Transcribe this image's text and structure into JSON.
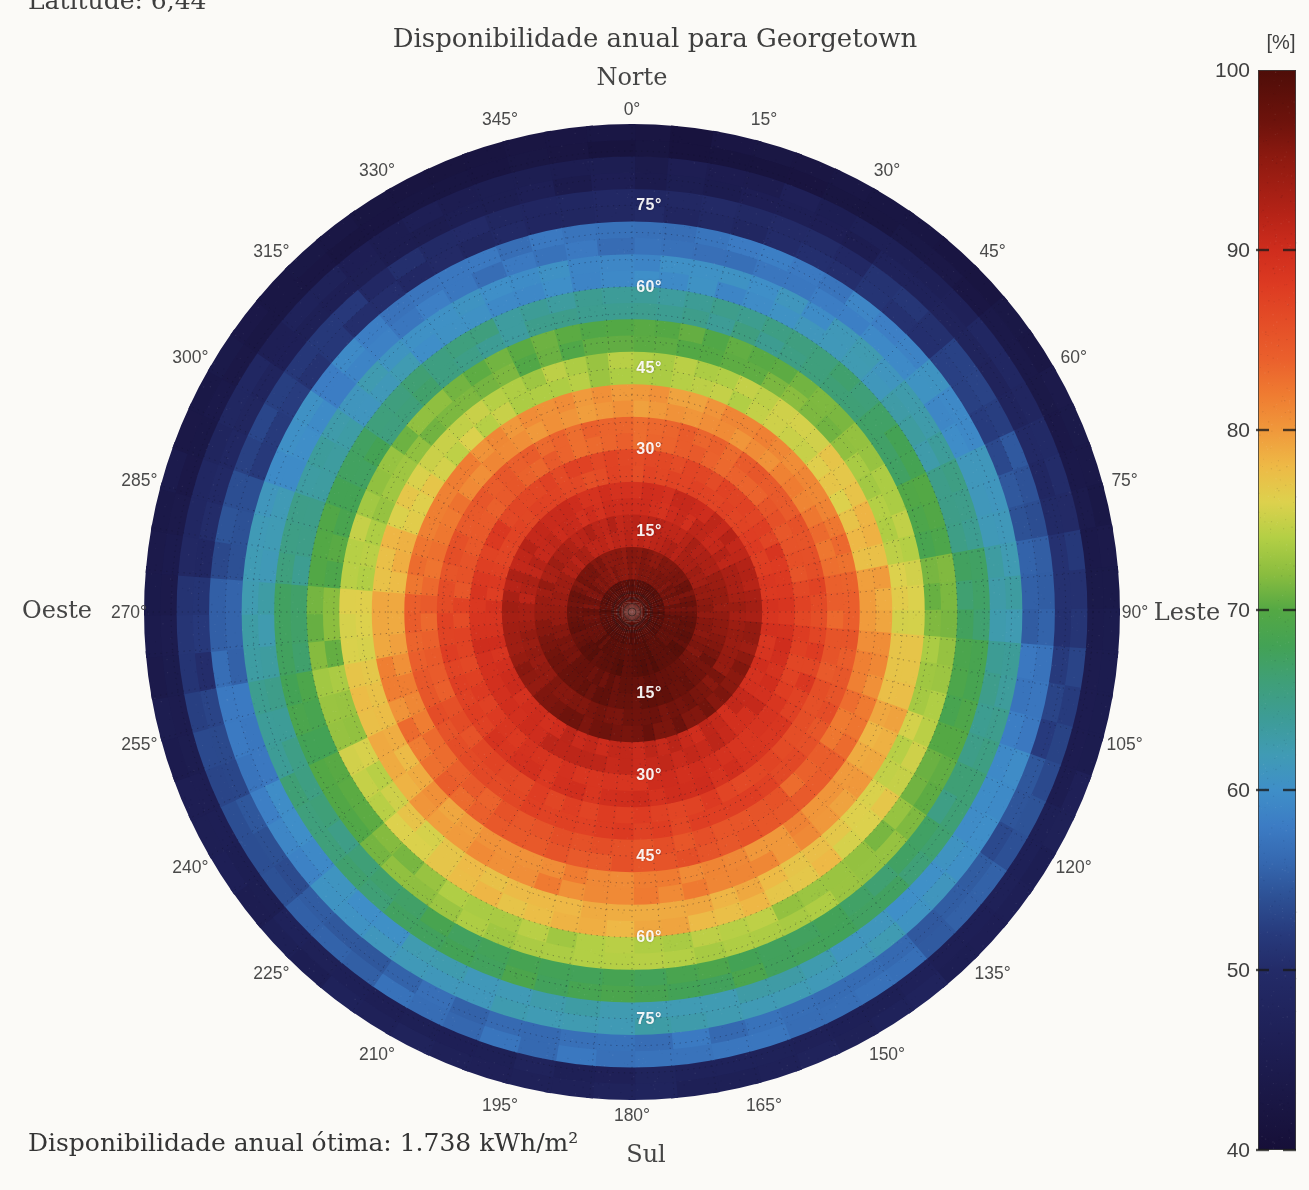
{
  "page": {
    "latitude_label": "Latitude: 6,44",
    "footer_label": "Disponibilidade anual ótima: 1.738 kWh/m²"
  },
  "chart_data": {
    "type": "polar_heatmap",
    "title": "Disponibilidade anual para Georgetown",
    "subtitle": "",
    "quantity": "Disponibilidade anual",
    "unit": "%",
    "optimal_annual_availability": "1.738 kWh/m²",
    "cardinals": {
      "north": "Norte",
      "east": "Leste",
      "south": "Sul",
      "west": "Oeste"
    },
    "azimuth_step_deg": 15,
    "azimuth_tick_labels": [
      "0°",
      "15°",
      "30°",
      "45°",
      "60°",
      "75°",
      "90°",
      "105°",
      "120°",
      "135°",
      "150°",
      "165°",
      "180°",
      "195°",
      "210°",
      "225°",
      "240°",
      "255°",
      "270°",
      "285°",
      "300°",
      "315°",
      "330°",
      "345°"
    ],
    "radial_axis": {
      "quantity": "inclinação",
      "min_deg": 0,
      "max_deg": 90,
      "ring_step_deg": 6,
      "label_step_deg": 15
    },
    "radial_tick_labels": [
      "15°",
      "30°",
      "45°",
      "60°",
      "75°"
    ],
    "tilt_ring_mid_deg": [
      3,
      9,
      15,
      21,
      27,
      33,
      39,
      45,
      51,
      57,
      63,
      69,
      75,
      81,
      87
    ],
    "values_by_azimuth": [
      {
        "azimuth_deg": 0,
        "values": [
          98.5,
          95.5,
          91.5,
          89.5,
          86.5,
          83.5,
          80.0,
          73.5,
          70.0,
          64.0,
          59.5,
          57.0,
          49.0,
          45.0,
          42.0
        ]
      },
      {
        "azimuth_deg": 15,
        "values": [
          98.5,
          95.6,
          91.6,
          89.6,
          86.6,
          83.6,
          80.1,
          73.7,
          70.2,
          64.2,
          59.7,
          57.2,
          49.2,
          45.2,
          42.1
        ]
      },
      {
        "azimuth_deg": 30,
        "values": [
          98.6,
          95.7,
          91.9,
          90.0,
          86.8,
          83.9,
          80.5,
          74.3,
          70.8,
          64.9,
          60.4,
          57.8,
          49.9,
          45.8,
          42.3
        ]
      },
      {
        "azimuth_deg": 45,
        "values": [
          98.6,
          96.0,
          92.4,
          90.6,
          87.2,
          84.4,
          81.1,
          75.2,
          71.7,
          66.1,
          61.6,
          58.7,
          51.0,
          46.7,
          42.7
        ]
      },
      {
        "azimuth_deg": 60,
        "values": [
          98.8,
          96.4,
          93.1,
          91.4,
          87.6,
          85.0,
          81.9,
          76.5,
          72.9,
          67.6,
          63.1,
          59.9,
          52.4,
          48.0,
          43.3
        ]
      },
      {
        "azimuth_deg": 75,
        "values": [
          98.9,
          96.8,
          93.9,
          92.3,
          88.2,
          85.7,
          82.8,
          77.9,
          74.3,
          69.4,
          64.9,
          61.3,
          54.0,
          49.4,
          43.9
        ]
      },
      {
        "azimuth_deg": 90,
        "values": [
          99.0,
          97.3,
          94.8,
          93.3,
          88.8,
          86.5,
          83.8,
          79.5,
          75.8,
          71.3,
          66.8,
          62.8,
          55.8,
          51.0,
          44.5
        ]
      },
      {
        "azimuth_deg": 105,
        "values": [
          99.1,
          97.7,
          95.6,
          94.2,
          89.3,
          87.3,
          84.7,
          81.1,
          77.3,
          73.1,
          68.6,
          64.3,
          57.5,
          52.6,
          45.2
        ]
      },
      {
        "azimuth_deg": 120,
        "values": [
          99.3,
          98.1,
          96.4,
          95.1,
          89.9,
          88.0,
          85.6,
          82.5,
          78.6,
          74.9,
          70.4,
          65.6,
          59.1,
          54.0,
          45.8
        ]
      },
      {
        "azimuth_deg": 135,
        "values": [
          99.4,
          98.5,
          97.1,
          95.9,
          90.3,
          88.6,
          86.4,
          83.8,
          79.8,
          76.4,
          71.9,
          66.8,
          60.5,
          55.3,
          46.3
        ]
      },
      {
        "azimuth_deg": 150,
        "values": [
          99.4,
          98.8,
          97.6,
          96.5,
          90.7,
          89.1,
          87.0,
          84.7,
          80.8,
          77.6,
          73.1,
          67.8,
          61.6,
          56.2,
          46.7
        ]
      },
      {
        "azimuth_deg": 165,
        "values": [
          99.5,
          99.0,
          97.9,
          96.9,
          90.9,
          89.4,
          87.4,
          85.3,
          81.3,
          78.3,
          73.8,
          68.3,
          62.3,
          56.8,
          46.9
        ]
      },
      {
        "azimuth_deg": 180,
        "values": [
          99.5,
          99.0,
          98.0,
          97.0,
          91.0,
          89.5,
          87.5,
          85.5,
          81.5,
          78.5,
          74.0,
          68.5,
          62.5,
          57.0,
          47.0
        ]
      },
      {
        "azimuth_deg": 195,
        "values": [
          99.5,
          99.0,
          97.9,
          96.9,
          90.9,
          89.4,
          87.4,
          85.3,
          81.3,
          78.3,
          73.8,
          68.3,
          62.3,
          56.8,
          46.9
        ]
      },
      {
        "azimuth_deg": 210,
        "values": [
          99.4,
          98.8,
          97.6,
          96.5,
          90.7,
          89.1,
          87.0,
          84.7,
          80.8,
          77.6,
          73.1,
          67.8,
          61.6,
          56.2,
          46.7
        ]
      },
      {
        "azimuth_deg": 225,
        "values": [
          99.4,
          98.5,
          97.1,
          95.9,
          90.3,
          88.6,
          86.4,
          83.8,
          79.8,
          76.4,
          71.9,
          66.8,
          60.5,
          55.3,
          46.3
        ]
      },
      {
        "azimuth_deg": 240,
        "values": [
          99.3,
          98.1,
          96.4,
          95.1,
          89.9,
          88.0,
          85.6,
          82.5,
          78.6,
          74.9,
          70.4,
          65.6,
          59.1,
          54.0,
          45.8
        ]
      },
      {
        "azimuth_deg": 255,
        "values": [
          99.1,
          97.7,
          95.6,
          94.2,
          89.3,
          87.3,
          84.7,
          81.1,
          77.3,
          73.1,
          68.6,
          64.3,
          57.5,
          52.6,
          45.2
        ]
      },
      {
        "azimuth_deg": 270,
        "values": [
          99.0,
          97.3,
          94.8,
          93.3,
          88.8,
          86.5,
          83.8,
          79.5,
          75.8,
          71.3,
          66.8,
          62.8,
          55.8,
          51.0,
          44.5
        ]
      },
      {
        "azimuth_deg": 285,
        "values": [
          98.9,
          96.8,
          93.9,
          92.3,
          88.2,
          85.7,
          82.8,
          77.9,
          74.3,
          69.4,
          64.9,
          61.3,
          54.0,
          49.4,
          43.9
        ]
      },
      {
        "azimuth_deg": 300,
        "values": [
          98.8,
          96.4,
          93.1,
          91.4,
          87.6,
          85.0,
          81.9,
          76.5,
          72.9,
          67.6,
          63.1,
          59.9,
          52.4,
          48.0,
          43.3
        ]
      },
      {
        "azimuth_deg": 315,
        "values": [
          98.6,
          96.0,
          92.4,
          90.6,
          87.2,
          84.4,
          81.1,
          75.2,
          71.7,
          66.1,
          61.6,
          58.7,
          51.0,
          46.7,
          42.7
        ]
      },
      {
        "azimuth_deg": 330,
        "values": [
          98.6,
          95.7,
          91.9,
          90.0,
          86.8,
          83.9,
          80.5,
          74.3,
          70.8,
          64.9,
          60.4,
          57.8,
          49.9,
          45.8,
          42.3
        ]
      },
      {
        "azimuth_deg": 345,
        "values": [
          98.5,
          95.6,
          91.6,
          89.6,
          86.6,
          83.6,
          80.1,
          73.7,
          70.2,
          64.2,
          59.7,
          57.2,
          49.2,
          45.2,
          42.1
        ]
      }
    ],
    "colorbar": {
      "unit_label": "[%]",
      "min": 40,
      "max": 100,
      "tick_values": [
        100,
        90,
        80,
        70,
        60,
        50,
        40
      ],
      "gradient_stops": [
        {
          "value": 100,
          "color": "#4e0d08"
        },
        {
          "value": 97,
          "color": "#6f130c"
        },
        {
          "value": 95,
          "color": "#8f1a10"
        },
        {
          "value": 92,
          "color": "#b52317"
        },
        {
          "value": 90,
          "color": "#cf2d1d"
        },
        {
          "value": 88,
          "color": "#dd3b22"
        },
        {
          "value": 86,
          "color": "#e44d27"
        },
        {
          "value": 84,
          "color": "#ea5f2c"
        },
        {
          "value": 82,
          "color": "#ef7b31"
        },
        {
          "value": 80,
          "color": "#f0983b"
        },
        {
          "value": 78,
          "color": "#eeb946"
        },
        {
          "value": 76,
          "color": "#ddd14d"
        },
        {
          "value": 74,
          "color": "#b3cf45"
        },
        {
          "value": 72,
          "color": "#8abd3f"
        },
        {
          "value": 70,
          "color": "#54a844"
        },
        {
          "value": 68,
          "color": "#43a255"
        },
        {
          "value": 66,
          "color": "#3f9f78"
        },
        {
          "value": 64,
          "color": "#3d9c96"
        },
        {
          "value": 62,
          "color": "#409bb4"
        },
        {
          "value": 60,
          "color": "#3f8fc8"
        },
        {
          "value": 58,
          "color": "#3c7cc4"
        },
        {
          "value": 56,
          "color": "#3568b0"
        },
        {
          "value": 54,
          "color": "#2d5094"
        },
        {
          "value": 52,
          "color": "#273a7c"
        },
        {
          "value": 50,
          "color": "#232b68"
        },
        {
          "value": 46,
          "color": "#1e1f55"
        },
        {
          "value": 42,
          "color": "#191541"
        },
        {
          "value": 40,
          "color": "#160f38"
        }
      ]
    }
  }
}
